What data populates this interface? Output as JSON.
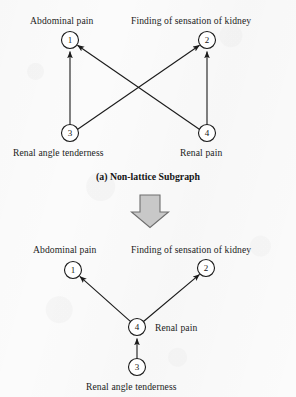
{
  "figure": {
    "panels": [
      {
        "id": "panel-a",
        "caption_index": "(a)",
        "caption_text": "Non-lattice Subgraph",
        "nodes": [
          {
            "id": "n1",
            "number": "1",
            "label": "Abdominal pain",
            "cx": 70,
            "cy": 40,
            "r": 8.5
          },
          {
            "id": "n2",
            "number": "2",
            "label": "Finding of sensation of kidney",
            "cx": 207,
            "cy": 40,
            "r": 8.5
          },
          {
            "id": "n3",
            "number": "3",
            "label": "Renal angle tenderness",
            "cx": 70,
            "cy": 133,
            "r": 8.5
          },
          {
            "id": "n4",
            "number": "4",
            "label": "Renal pain",
            "cx": 207,
            "cy": 133,
            "r": 8.5
          }
        ],
        "edges": [
          {
            "id": "e31",
            "from": "3",
            "to": "1"
          },
          {
            "id": "e32",
            "from": "3",
            "to": "2"
          },
          {
            "id": "e41",
            "from": "4",
            "to": "1"
          },
          {
            "id": "e42",
            "from": "4",
            "to": "2"
          }
        ]
      },
      {
        "id": "panel-b",
        "caption_index": "",
        "caption_text": "",
        "nodes": [
          {
            "id": "m1",
            "number": "1",
            "label": "Abdominal pain",
            "cx": 73,
            "cy": 270,
            "r": 8.5
          },
          {
            "id": "m2",
            "number": "2",
            "label": "Finding of sensation of kidney",
            "cx": 206,
            "cy": 268,
            "r": 8.5
          },
          {
            "id": "m4",
            "number": "4",
            "label": "Renal pain",
            "cx": 137,
            "cy": 327,
            "r": 8.5
          },
          {
            "id": "m3",
            "number": "3",
            "label": "Renal angle tenderness",
            "cx": 137,
            "cy": 367,
            "r": 8.5
          }
        ],
        "edges": [
          {
            "id": "f41",
            "from": "4",
            "to": "1"
          },
          {
            "id": "f42",
            "from": "4",
            "to": "2"
          },
          {
            "id": "f34",
            "from": "3",
            "to": "4"
          }
        ]
      }
    ],
    "transition_arrow": {
      "name": "down-block-arrow",
      "direction": "down"
    },
    "labels": {
      "abdominal_pain": "Abdominal pain",
      "finding_of_sensation_of_kidney": "Finding of sensation of kidney",
      "renal_angle_tenderness": "Renal angle tenderness",
      "renal_pain": "Renal pain",
      "caption_a_index": "(a)",
      "caption_a_text": "Non-lattice Subgraph"
    },
    "numbers": {
      "one": "1",
      "two": "2",
      "three": "3",
      "four": "4"
    },
    "colors": {
      "stroke": "#1a1a1a",
      "node_fill": "#ffffff",
      "arrow_fill": "#c8c8c8",
      "arrow_stroke": "#6e6e6e",
      "background": "#fbfbfb"
    }
  }
}
